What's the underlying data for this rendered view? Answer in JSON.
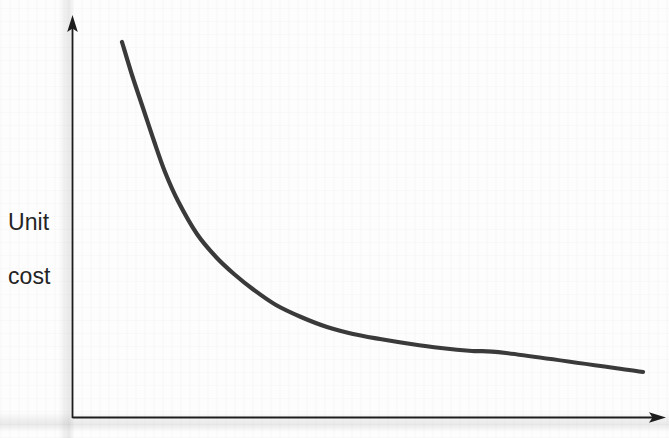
{
  "figure": {
    "background_color": "#fdfdfd",
    "axis_color": "#1d1d1d",
    "curve_color": "#3a3a3a",
    "label_color": "#242424"
  },
  "axes": {
    "y_label_line1": "Unit",
    "y_label_line2": "cost",
    "y_axis_name": "y-axis",
    "x_axis_name": "x-axis",
    "y_arrow_name": "y-axis-arrowhead",
    "x_arrow_name": "x-axis-arrowhead",
    "x_label": ""
  },
  "chart_data": {
    "type": "line",
    "title": "",
    "subtitle": "",
    "xlabel": "",
    "ylabel": "Unit cost",
    "grid": false,
    "legend": null,
    "legend_position": "none",
    "annotations": [],
    "axis_arrows": {
      "x": true,
      "y": true
    },
    "xlim": [
      0,
      100
    ],
    "ylim": [
      0,
      100
    ],
    "x_tick_labels": [],
    "y_tick_labels": [],
    "series": [
      {
        "name": "Unit cost",
        "color": "#3a3a3a",
        "x": [
          8.8,
          11.0,
          13.5,
          16.0,
          18.5,
          21.5,
          25.7,
          30.0,
          34.0,
          38.5,
          43.5,
          49.0,
          55.0,
          61.0,
          67.0,
          74.0,
          81.0,
          88.0,
          95.8
        ],
        "y": [
          93.5,
          85.0,
          76.5,
          68.0,
          60.0,
          52.5,
          44.0,
          38.0,
          33.5,
          29.5,
          25.5,
          22.5,
          20.0,
          18.3,
          16.9,
          15.7,
          14.7,
          14.0,
          13.6
        ]
      }
    ],
    "curve_pixel_points": [
      [
        122,
        42
      ],
      [
        132,
        75
      ],
      [
        143,
        108
      ],
      [
        154,
        141
      ],
      [
        165,
        172
      ],
      [
        178,
        201
      ],
      [
        197,
        234
      ],
      [
        216,
        257
      ],
      [
        234,
        274
      ],
      [
        254,
        290
      ],
      [
        276,
        305
      ],
      [
        301,
        317
      ],
      [
        327,
        327
      ],
      [
        353,
        334
      ],
      [
        380,
        339
      ],
      [
        411,
        344
      ],
      [
        441,
        348
      ],
      [
        472,
        351
      ],
      [
        506,
        353
      ],
      [
        643,
        372
      ]
    ]
  }
}
